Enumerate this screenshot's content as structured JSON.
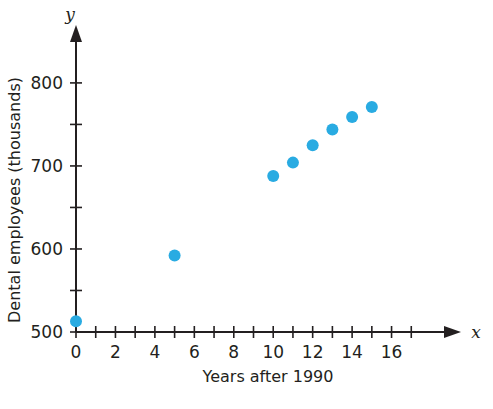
{
  "chart_data": {
    "type": "scatter",
    "title": "",
    "xlabel": "Years after 1990",
    "ylabel": "Dental employees (thousands)",
    "x_axis_variable": "x",
    "y_axis_variable": "y",
    "xlim": [
      0,
      18
    ],
    "ylim": [
      500,
      830
    ],
    "grid": false,
    "legend": null,
    "x_tick_step": 1,
    "y_tick_step": 50,
    "x_tick_labels": [
      "0",
      "2",
      "4",
      "6",
      "8",
      "10",
      "12",
      "14",
      "16"
    ],
    "x_tick_label_values": [
      0,
      2,
      4,
      6,
      8,
      10,
      12,
      14,
      16
    ],
    "x_tick_values": [
      0,
      1,
      2,
      3,
      4,
      5,
      6,
      7,
      8,
      9,
      10,
      11,
      12,
      13,
      14,
      15,
      16,
      17
    ],
    "y_tick_labels": [
      "500",
      "600",
      "700",
      "800"
    ],
    "y_tick_label_values": [
      500,
      600,
      700,
      800
    ],
    "y_tick_values": [
      500,
      550,
      600,
      650,
      700,
      750,
      800
    ],
    "x": [
      0,
      5,
      10,
      11,
      12,
      13,
      14,
      15
    ],
    "values": [
      513,
      592,
      688,
      704,
      725,
      744,
      759,
      771
    ],
    "points": [
      {
        "x": 0,
        "y": 513
      },
      {
        "x": 5,
        "y": 592
      },
      {
        "x": 10,
        "y": 688
      },
      {
        "x": 11,
        "y": 704
      },
      {
        "x": 12,
        "y": 725
      },
      {
        "x": 13,
        "y": 744
      },
      {
        "x": 14,
        "y": 759
      },
      {
        "x": 15,
        "y": 771
      }
    ],
    "marker_color": "#29abe2",
    "axis_color": "#231f20",
    "background_color": "#ffffff",
    "marker_radius": 6
  }
}
